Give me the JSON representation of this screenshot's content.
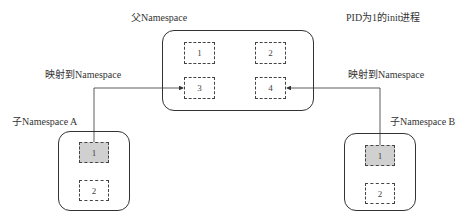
{
  "parent": {
    "label": "父Namespace",
    "init_label": "PID为1的init进程",
    "pids": [
      "1",
      "2",
      "3",
      "4"
    ]
  },
  "child_a": {
    "label": "子Namespace A",
    "map_label": "映射到Namespace",
    "pids": [
      "1",
      "2"
    ],
    "maps_to": "3"
  },
  "child_b": {
    "label": "子Namespace B",
    "map_label": "映射到Namespace",
    "pids": [
      "1",
      "2"
    ],
    "maps_to": "4"
  }
}
